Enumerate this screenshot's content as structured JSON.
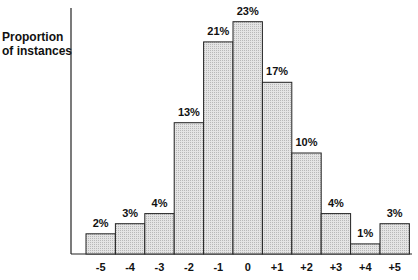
{
  "chart_data": {
    "type": "bar",
    "title": "",
    "xlabel": "",
    "ylabel": "Proportion of instances",
    "ylabel_lines": [
      "Proportion",
      "of instances"
    ],
    "categories": [
      "-5",
      "-4",
      "-3",
      "-2",
      "-1",
      "0",
      "+1",
      "+2",
      "+3",
      "+4",
      "+5"
    ],
    "values": [
      2,
      3,
      4,
      13,
      21,
      23,
      17,
      10,
      4,
      1,
      3
    ],
    "value_labels": [
      "2%",
      "3%",
      "4%",
      "13%",
      "21%",
      "23%",
      "17%",
      "10%",
      "4%",
      "1%",
      "3%"
    ],
    "unit": "%",
    "ylim": [
      0,
      25
    ],
    "grid": false,
    "legend": null,
    "bar_fill": "#d9d9d9",
    "bar_stroke": "#222222"
  }
}
